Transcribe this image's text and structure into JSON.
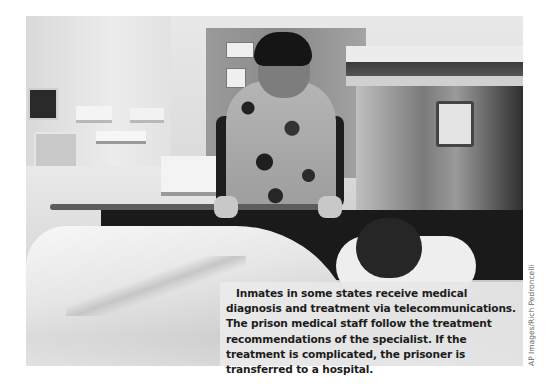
{
  "figure": {
    "photo_description": "Medical staff member in patterned scrubs leaning over a patient lying in a hospital bed, with medical equipment in background",
    "caption": "Inmates in some states receive medical diagnosis and treatment via telecommunications. The prison medical staff follow the treatment recommendations of the specialist. If the treatment is complicated, the prisoner is transferred to a hospital.",
    "credit": "AP Images/Rich Pedroncelli"
  }
}
